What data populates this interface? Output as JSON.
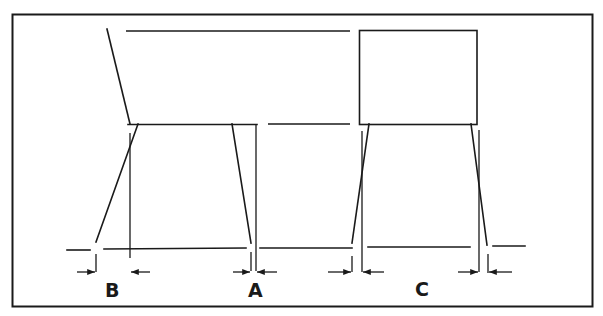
{
  "diagram": {
    "title": "",
    "colors": {
      "line": "#1a1a1a",
      "background": "#ffffff"
    },
    "views": [
      {
        "name": "side-view",
        "dimensions": [
          "B",
          "A"
        ]
      },
      {
        "name": "front-view",
        "dimensions": [
          "C"
        ]
      }
    ],
    "labels": {
      "b": "B",
      "a": "A",
      "c": "C"
    }
  }
}
